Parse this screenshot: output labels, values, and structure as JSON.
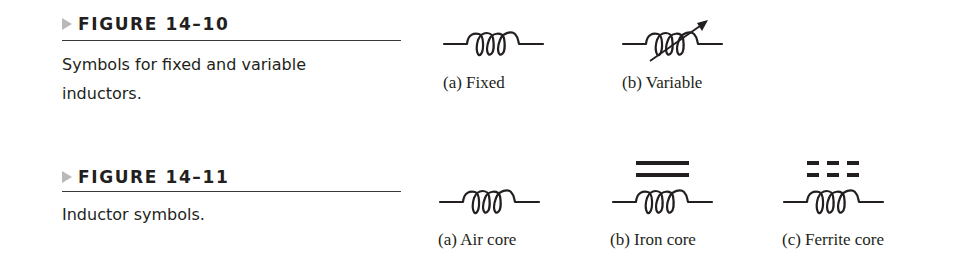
{
  "figures": [
    {
      "number": "FIGURE 14–10",
      "caption": "Symbols for fixed and variable inductors.",
      "symbols": [
        {
          "icon": "fixed-inductor-icon",
          "label": "(a)  Fixed"
        },
        {
          "icon": "variable-inductor-icon",
          "label": "(b)  Variable"
        }
      ]
    },
    {
      "number": "FIGURE 14–11",
      "caption": "Inductor symbols.",
      "symbols": [
        {
          "icon": "air-core-inductor-icon",
          "label": "(a)  Air core"
        },
        {
          "icon": "iron-core-inductor-icon",
          "label": "(b)  Iron core"
        },
        {
          "icon": "ferrite-core-inductor-icon",
          "label": "(c)  Ferrite core"
        }
      ]
    }
  ],
  "colors": {
    "ink": "#231f20",
    "arrow_gray": "#b9b9b9"
  }
}
